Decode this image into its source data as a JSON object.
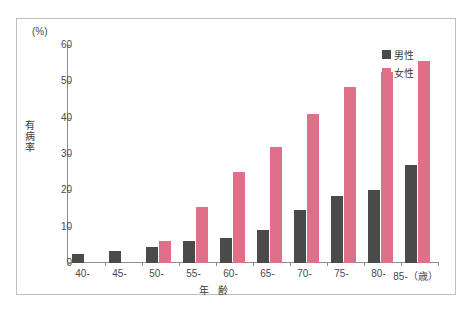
{
  "chart_data": {
    "type": "bar",
    "title": "",
    "xlabel": "年 齢",
    "ylabel": "有病率",
    "unit_label": "(%)",
    "categories": [
      "40-",
      "45-",
      "50-",
      "55-",
      "60-",
      "65-",
      "70-",
      "75-",
      "80-",
      "85-（歳）"
    ],
    "ylim": [
      0,
      60
    ],
    "yticks": [
      0,
      10,
      20,
      30,
      40,
      50,
      60
    ],
    "grid": false,
    "legend_position": "top-right",
    "series": [
      {
        "name": "男性",
        "color": "#4a4a4a",
        "values": [
          2.5,
          3.3,
          4.3,
          6.0,
          7.0,
          9.0,
          14.5,
          18.5,
          20.0,
          27.0
        ]
      },
      {
        "name": "女性",
        "color": "#e0708a",
        "values": [
          0,
          0,
          6.0,
          15.5,
          25.0,
          32.0,
          41.0,
          48.5,
          52.5,
          55.5
        ]
      }
    ]
  },
  "caption": {
    "text": ""
  }
}
